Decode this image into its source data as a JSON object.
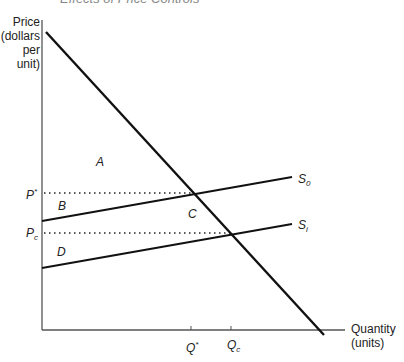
{
  "figure": {
    "cut_title": "Effects of Price Controls",
    "y_axis": {
      "line1": "Price",
      "line2": "(dollars",
      "line3": "per unit)"
    },
    "x_axis": {
      "line1": "Quantity",
      "line2": "(units)"
    },
    "price_labels": {
      "p_star": {
        "main": "P",
        "sup": "*"
      },
      "p_c": {
        "main": "P",
        "sub": "c"
      }
    },
    "quantity_labels": {
      "q_star": {
        "main": "Q",
        "sup": "*"
      },
      "q_c": {
        "main": "Q",
        "sub": "c"
      }
    },
    "curve_labels": {
      "s0": {
        "main": "S",
        "sub": "0"
      },
      "si": {
        "main": "S",
        "sub": "i"
      }
    },
    "regions": {
      "a": "A",
      "b": "B",
      "c": "C",
      "d": "D"
    },
    "colors": {
      "curve": "#111111",
      "axis": "#555555",
      "dotted": "#222222"
    }
  }
}
